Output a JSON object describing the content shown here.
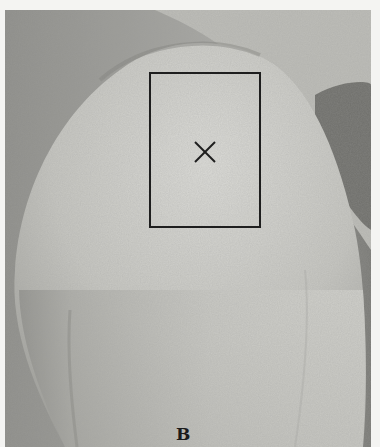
{
  "figure": {
    "panel_label": "B",
    "marking": {
      "rect": {
        "x": 149,
        "y": 72,
        "width": 112,
        "height": 156
      },
      "x_mark_center": {
        "x": 205,
        "y": 152
      },
      "color": "#1e1e1e"
    },
    "colors": {
      "background": "#f4f4f2",
      "skin_light": "#d8d8d4",
      "skin_mid": "#b9b9b4",
      "shadow": "#6e6e6a"
    }
  }
}
